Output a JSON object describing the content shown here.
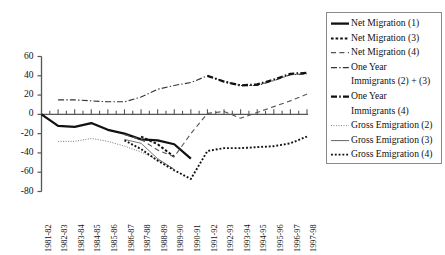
{
  "chart_data": {
    "type": "line",
    "title": "",
    "xlabel": "",
    "ylabel": "",
    "ylim": [
      -80,
      60
    ],
    "yticks": [
      60,
      40,
      20,
      0,
      -20,
      -40,
      -60,
      -80
    ],
    "grid": false,
    "legend_position": "right",
    "categories": [
      "1981-82",
      "1982-83",
      "1983-84",
      "1984-85",
      "1985-86",
      "1986-87",
      "1987-88",
      "1988-89",
      "1989-90",
      "1990-91",
      "1991-92",
      "1992-93",
      "1993-94",
      "1994-95",
      "1995-96",
      "1996-97",
      "1997-98"
    ],
    "series": [
      {
        "name": "Net Migration (1)",
        "style": "solid-thick",
        "color": "#111111",
        "values": [
          0,
          -12,
          -13,
          -9,
          -16,
          -20,
          -26,
          -27,
          -31,
          -46,
          null,
          null,
          null,
          null,
          null,
          null,
          null
        ]
      },
      {
        "name": "Net Migration (3)",
        "style": "dotted",
        "color": "#111111",
        "values": [
          null,
          null,
          null,
          null,
          null,
          null,
          -23,
          -31,
          -44,
          null,
          null,
          null,
          null,
          null,
          null,
          null,
          null
        ]
      },
      {
        "name": "Net Migration (4)",
        "style": "dashed",
        "color": "#555555",
        "values": [
          null,
          null,
          null,
          null,
          null,
          -21,
          -26,
          -37,
          -44,
          -20,
          1,
          3,
          -4,
          2,
          8,
          14,
          21
        ]
      },
      {
        "name": "One Year Immigrants (2) + (3)",
        "style": "dash-dot",
        "color": "#333333",
        "values": [
          null,
          15,
          15,
          14,
          13,
          13,
          18,
          26,
          30,
          33,
          40,
          34,
          30,
          30,
          35,
          41,
          42
        ]
      },
      {
        "name": "One Year Immigrants (4)",
        "style": "dash-dot-thick",
        "color": "#111111",
        "values": [
          null,
          null,
          null,
          null,
          null,
          null,
          null,
          null,
          null,
          null,
          40,
          34,
          30,
          31,
          36,
          42,
          43
        ]
      },
      {
        "name": "Gross Emigration (2)",
        "style": "fine-dotted",
        "color": "#777777",
        "values": [
          null,
          -28,
          -28,
          -25,
          -28,
          -33,
          -39,
          -47,
          -57,
          null,
          null,
          null,
          null,
          null,
          null,
          null,
          null
        ]
      },
      {
        "name": "Gross Emigration (3)",
        "style": "thin-solid",
        "color": "#666666",
        "values": [
          null,
          null,
          null,
          null,
          null,
          -26,
          -30,
          -46,
          -57,
          null,
          null,
          null,
          null,
          null,
          null,
          null,
          null
        ]
      },
      {
        "name": "Gross Emigration (4)",
        "style": "coarse-dotted",
        "color": "#111111",
        "values": [
          null,
          null,
          null,
          null,
          null,
          -27,
          -36,
          -48,
          -58,
          -67,
          -38,
          -35,
          -35,
          -34,
          -33,
          -30,
          -23
        ]
      }
    ]
  },
  "yaxis": {
    "labels": [
      "60",
      "40",
      "20",
      "0",
      "-20",
      "-40",
      "-60",
      "-80"
    ]
  },
  "xaxis": {
    "labels": [
      "1981-82",
      "1982-83",
      "1983-84",
      "1984-85",
      "1985-86",
      "1986-87",
      "1987-88",
      "1988-89",
      "1989-90",
      "1990-91",
      "1991-92",
      "1992-93",
      "1993-94",
      "1994-95",
      "1995-96",
      "1996-97",
      "1997-98"
    ]
  },
  "legend": {
    "entries": [
      {
        "label": "Net Migration (1)",
        "label2": "",
        "sample": "solid-thick"
      },
      {
        "label": "Net Migration (3)",
        "label2": "",
        "sample": "dotted"
      },
      {
        "label": "Net Migration (4)",
        "label2": "",
        "sample": "dashed"
      },
      {
        "label": "One Year",
        "label2": "Immigrants (2) + (3)",
        "sample": "dash-dot"
      },
      {
        "label": "One Year",
        "label2": "Immigrants (4)",
        "sample": "dash-dot-thick"
      },
      {
        "label": "Gross Emigration (2)",
        "label2": "",
        "sample": "fine-dotted"
      },
      {
        "label": "Gross Emigration (3)",
        "label2": "",
        "sample": "thin-solid"
      },
      {
        "label": "Gross Emigration (4)",
        "label2": "",
        "sample": "coarse-dotted"
      }
    ]
  },
  "colors": {
    "axis": "#555555",
    "text": "#111111",
    "legend_border": "#8a8a8a",
    "background": "#ffffff"
  }
}
